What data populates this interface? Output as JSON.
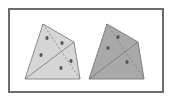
{
  "figure": {
    "width": 170,
    "height": 99,
    "background": "#ffffff",
    "frame": {
      "x": 9,
      "y": 9,
      "w": 154,
      "h": 83,
      "stroke": "#6b6b6b",
      "stroke_width": 2
    }
  },
  "shapes": [
    {
      "name": "left-quadrilateral",
      "fill": "#d6d6d6",
      "stroke": "#8a8a8a",
      "vertices": [
        [
          43,
          24
        ],
        [
          74,
          42
        ],
        [
          80,
          79
        ],
        [
          25,
          79
        ]
      ],
      "diagonal": [
        [
          25,
          79
        ],
        [
          74,
          42
        ]
      ],
      "dashed": [
        [
          43,
          24
        ],
        [
          80,
          79
        ]
      ],
      "dots": [
        [
          47,
          38
        ],
        [
          62,
          43
        ],
        [
          41,
          55
        ],
        [
          71,
          61
        ],
        [
          61,
          68
        ]
      ]
    },
    {
      "name": "right-quadrilateral",
      "fill": "#a9a9a9",
      "stroke": "#808080",
      "vertices": [
        [
          107,
          24
        ],
        [
          138,
          42
        ],
        [
          144,
          79
        ],
        [
          89,
          79
        ]
      ],
      "diagonal": [
        [
          89,
          79
        ],
        [
          138,
          42
        ]
      ],
      "dashed": [
        [
          107,
          24
        ],
        [
          144,
          79
        ]
      ],
      "dots": [
        [
          118,
          37
        ],
        [
          108,
          48
        ],
        [
          127,
          62
        ]
      ]
    }
  ],
  "colors": {
    "dot": "#555555",
    "dash": "#7a7a7a"
  }
}
